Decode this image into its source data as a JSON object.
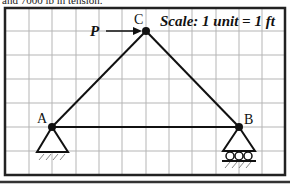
{
  "caption": "and 7000 lb in tension.",
  "diagram": {
    "scale_label": "Scale: 1 unit = 1 ft",
    "grid": {
      "frame": {
        "x": 5,
        "y": 8,
        "width": 280,
        "height": 167
      },
      "vertical_lines_x": [
        29,
        52,
        76,
        99,
        122,
        146,
        169,
        192,
        216,
        239,
        262
      ],
      "horizontal_lines_y": [
        31,
        55,
        79,
        103,
        127,
        151
      ]
    },
    "nodes": [
      {
        "id": "A",
        "label": "A",
        "x": 52,
        "y": 127,
        "support": "pin"
      },
      {
        "id": "B",
        "label": "B",
        "x": 239,
        "y": 127,
        "support": "roller"
      },
      {
        "id": "C",
        "label": "C",
        "x": 146,
        "y": 31,
        "support": "none"
      }
    ],
    "members": [
      {
        "from": "A",
        "to": "C"
      },
      {
        "from": "C",
        "to": "B"
      },
      {
        "from": "A",
        "to": "B"
      }
    ],
    "loads": [
      {
        "label": "P",
        "at": "C",
        "direction": "right"
      }
    ],
    "colors": {
      "frame": "#222222",
      "grid": "#b5b5b5",
      "member": "#111111"
    }
  }
}
